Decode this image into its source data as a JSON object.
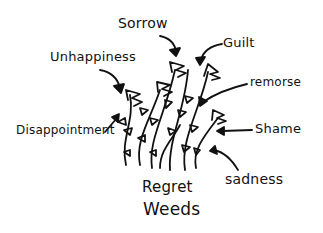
{
  "diagram": {
    "title_line1": "Regret",
    "title_line2": "Weeds",
    "labels": {
      "sorrow": "Sorrow",
      "unhappiness": "Unhappiness",
      "guilt": "Guilt",
      "remorse": "remorse",
      "disappointment": "Disappointment",
      "shame": "Shame",
      "sadness": "sadness"
    },
    "colors": {
      "ink": "#111111",
      "paper": "#ffffff"
    }
  }
}
